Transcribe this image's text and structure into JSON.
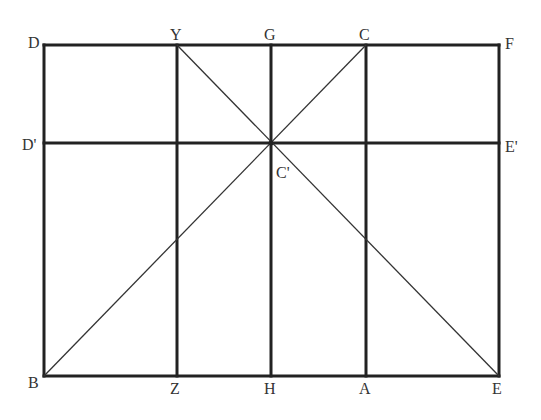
{
  "diagram": {
    "type": "geometric-construction",
    "colors": {
      "line": "#222222",
      "label": "#333333",
      "background": "#ffffff"
    },
    "points": {
      "D": {
        "label": "D",
        "x": 44,
        "y": 45
      },
      "Y": {
        "label": "Y",
        "x": 177,
        "y": 45
      },
      "G": {
        "label": "G",
        "x": 271,
        "y": 45
      },
      "C": {
        "label": "C",
        "x": 366,
        "y": 45
      },
      "F": {
        "label": "F",
        "x": 499,
        "y": 45
      },
      "D_prime": {
        "label": "D'",
        "x": 44,
        "y": 143
      },
      "C_prime": {
        "label": "C'",
        "x": 271,
        "y": 143
      },
      "E_prime": {
        "label": "E'",
        "x": 499,
        "y": 143
      },
      "B": {
        "label": "B",
        "x": 44,
        "y": 376
      },
      "Z": {
        "label": "Z",
        "x": 177,
        "y": 376
      },
      "H": {
        "label": "H",
        "x": 271,
        "y": 376
      },
      "A": {
        "label": "A",
        "x": 366,
        "y": 376
      },
      "E": {
        "label": "E",
        "x": 499,
        "y": 376
      }
    },
    "thick_segments": [
      [
        "D",
        "F"
      ],
      [
        "B",
        "E"
      ],
      [
        "D",
        "B"
      ],
      [
        "F",
        "E"
      ],
      [
        "D_prime",
        "E_prime"
      ],
      [
        "Y",
        "Z"
      ],
      [
        "G",
        "H"
      ],
      [
        "C",
        "A"
      ]
    ],
    "thin_segments": [
      [
        "B",
        "C"
      ],
      [
        "Y",
        "E"
      ]
    ]
  }
}
